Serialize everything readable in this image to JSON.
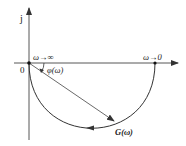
{
  "diagram": {
    "axes": {
      "imag_label": "j",
      "origin_label": "0"
    },
    "labels": {
      "omega_inf": "ω→∞",
      "omega_zero": "ω→0",
      "phase": "φ(ω)",
      "transfer": "G(ω)"
    },
    "colors": {
      "line": "#333333"
    }
  }
}
